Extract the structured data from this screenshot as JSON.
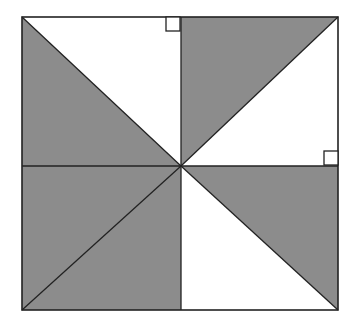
{
  "diagram": {
    "colors": {
      "background": "#ffffff",
      "shade": "#8c8c8c",
      "stroke": "#222222"
    },
    "square": {
      "x": 22,
      "y": 17,
      "width": 316,
      "height": 293
    },
    "center": {
      "x": 181,
      "y": 166
    },
    "shaded_regions": [
      {
        "name": "top-left-lower-triangle",
        "points": "22,17 181,166 22,166"
      },
      {
        "name": "top-right-upper-triangle",
        "points": "181,17 338,17 181,166"
      },
      {
        "name": "bottom-left-quadrant",
        "points": "22,166 181,166 181,310 22,310"
      },
      {
        "name": "bottom-right-upper-triangle",
        "points": "181,166 338,166 338,310"
      }
    ],
    "lines": [
      {
        "name": "vertical-midline",
        "x1": 181,
        "y1": 17,
        "x2": 181,
        "y2": 310
      },
      {
        "name": "horizontal-midline",
        "x1": 22,
        "y1": 166,
        "x2": 338,
        "y2": 166
      },
      {
        "name": "diagonal-top-left",
        "x1": 22,
        "y1": 17,
        "x2": 181,
        "y2": 166
      },
      {
        "name": "diagonal-top-right",
        "x1": 181,
        "y1": 166,
        "x2": 338,
        "y2": 17
      },
      {
        "name": "diagonal-bottom-left",
        "x1": 22,
        "y1": 310,
        "x2": 181,
        "y2": 166
      },
      {
        "name": "diagonal-bottom-right",
        "x1": 181,
        "y1": 166,
        "x2": 338,
        "y2": 310
      }
    ],
    "right_angle_markers": [
      {
        "name": "right-angle-top",
        "x": 166,
        "y": 17,
        "size": 14
      },
      {
        "name": "right-angle-right",
        "x": 324,
        "y": 151,
        "size": 14
      }
    ]
  }
}
